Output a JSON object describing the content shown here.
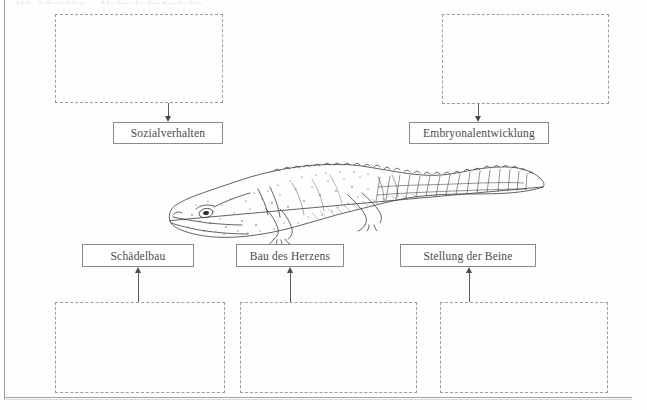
{
  "page": {
    "title_remnant": "Abb. Arbeitsblatt — Merkmale der Krokodile",
    "background_color": "#fefefe",
    "line_color": "#8a8a8a",
    "dash_color": "#9d9d9d",
    "text_color": "#4a4a4a"
  },
  "illustration": {
    "name": "crocodile-illustration",
    "caption": ""
  },
  "top_group": {
    "items": [
      {
        "id": "sozialverhalten",
        "label": "Sozialverhalten",
        "answer_value": "",
        "answer_placeholder": "",
        "arrow_direction": "down"
      },
      {
        "id": "embryonalentwicklung",
        "label": "Embryonalentwicklung",
        "answer_value": "",
        "answer_placeholder": "",
        "arrow_direction": "down"
      }
    ]
  },
  "bottom_group": {
    "items": [
      {
        "id": "schaedelbau",
        "label": "Schädelbau",
        "answer_value": "",
        "answer_placeholder": "",
        "arrow_direction": "up"
      },
      {
        "id": "bau-des-herzens",
        "label": "Bau des Herzens",
        "answer_value": "",
        "answer_placeholder": "",
        "arrow_direction": "up"
      },
      {
        "id": "stellung-der-beine",
        "label": "Stellung der Beine",
        "answer_value": "",
        "answer_placeholder": "",
        "arrow_direction": "up"
      }
    ]
  }
}
